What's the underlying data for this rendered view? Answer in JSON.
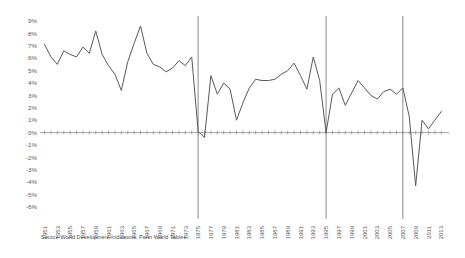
{
  "caption": {
    "source_text": "Source World Development Indicators, Penn World Tables"
  },
  "colors": {
    "line": "#595959",
    "axis": "#808080",
    "vline": "#808080",
    "tick_label": "#595959",
    "background": "#ffffff"
  },
  "chart_data": {
    "type": "line",
    "title": "",
    "subtitle": "",
    "xlabel": "",
    "ylabel": "",
    "grid": false,
    "legend": false,
    "legend_position": "none",
    "xlim": [
      1950,
      2014
    ],
    "ylim": [
      -0.06,
      0.09
    ],
    "ytick_labels": [
      "9%",
      "8%",
      "7%",
      "6%",
      "5%",
      "4%",
      "3%",
      "2%",
      "1%",
      "0%",
      "-1%",
      "-2%",
      "-3%",
      "-4%",
      "-5%",
      "-6%"
    ],
    "ytick_values": [
      0.09,
      0.08,
      0.07,
      0.06,
      0.05,
      0.04,
      0.03,
      0.02,
      0.01,
      0.0,
      -0.01,
      -0.02,
      -0.03,
      -0.04,
      -0.05,
      -0.06
    ],
    "xtick_labels": [
      "1951",
      "1953",
      "1955",
      "1957",
      "1959",
      "1961",
      "1963",
      "1965",
      "1967",
      "1969",
      "1971",
      "1973",
      "1975",
      "1977",
      "1979",
      "1981",
      "1983",
      "1985",
      "1987",
      "1989",
      "1991",
      "1993",
      "1995",
      "1997",
      "1999",
      "2001",
      "2003",
      "2005",
      "2007",
      "2009",
      "2011",
      "2013"
    ],
    "vertical_markers": [
      1975,
      1995,
      2007
    ],
    "series": [
      {
        "name": "Growth rate",
        "x": [
          1951,
          1952,
          1953,
          1954,
          1955,
          1956,
          1957,
          1958,
          1959,
          1960,
          1961,
          1962,
          1963,
          1964,
          1965,
          1966,
          1967,
          1968,
          1969,
          1970,
          1971,
          1972,
          1973,
          1974,
          1975,
          1976,
          1977,
          1978,
          1979,
          1980,
          1981,
          1982,
          1983,
          1984,
          1985,
          1986,
          1987,
          1988,
          1989,
          1990,
          1991,
          1992,
          1993,
          1994,
          1995,
          1996,
          1997,
          1998,
          1999,
          2000,
          2001,
          2002,
          2003,
          2004,
          2005,
          2006,
          2007,
          2008,
          2009,
          2010,
          2011,
          2012,
          2013
        ],
        "values": [
          7.1,
          6.1,
          5.5,
          6.6,
          6.3,
          6.1,
          6.9,
          6.4,
          8.2,
          6.3,
          5.4,
          4.7,
          3.4,
          5.7,
          7.2,
          8.6,
          6.4,
          5.5,
          5.3,
          4.9,
          5.2,
          5.8,
          5.4,
          6.1,
          0.1,
          -0.4,
          4.6,
          3.1,
          4.0,
          3.5,
          1.0,
          2.4,
          3.6,
          4.3,
          4.2,
          4.2,
          4.3,
          4.7,
          5.0,
          5.6,
          4.6,
          3.5,
          6.1,
          4.2,
          0.0,
          3.1,
          3.6,
          2.2,
          3.2,
          4.2,
          3.6,
          3.0,
          2.7,
          3.3,
          3.5,
          3.1,
          3.6,
          1.3,
          -4.3,
          1.0,
          0.3,
          1.0,
          1.7
        ]
      }
    ]
  }
}
